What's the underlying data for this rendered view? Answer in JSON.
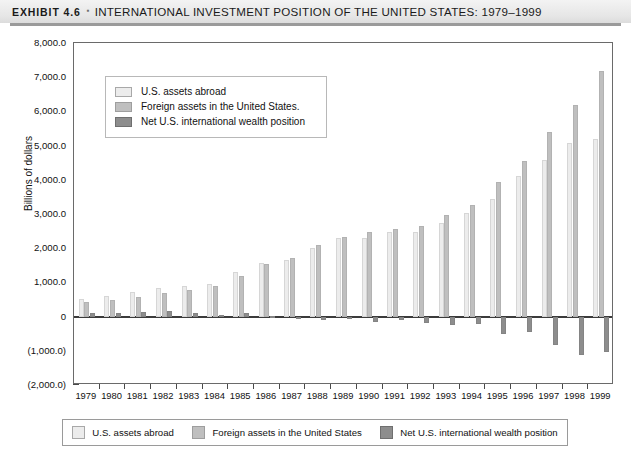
{
  "header": {
    "exhibit_label": "EXHIBIT 4.6",
    "bullet": "▪",
    "title": "INTERNATIONAL INVESTMENT POSITION OF THE UNITED STATES: 1979–1999"
  },
  "colors": {
    "series_us_assets": "#ececec",
    "series_foreign_assets": "#bfbfbf",
    "series_net_position": "#8d8d8d",
    "axis": "#3b3b3b",
    "frame": "#6a6a6a",
    "header_band": "#e6e6e6"
  },
  "inner_legend": {
    "items": [
      {
        "label": "U.S. assets abroad",
        "swatch": "sw0"
      },
      {
        "label": "Foreign assets in the United States.",
        "swatch": "sw1"
      },
      {
        "label": "Net U.S. international wealth position",
        "swatch": "sw2"
      }
    ]
  },
  "bottom_legend": {
    "items": [
      {
        "label": "U.S. assets abroad",
        "swatch": "sw0"
      },
      {
        "label": "Foreign assets in the United States",
        "swatch": "sw1"
      },
      {
        "label": "Net U.S. international wealth position",
        "swatch": "sw2"
      }
    ]
  },
  "chart_data": {
    "type": "bar",
    "title": "INTERNATIONAL INVESTMENT POSITION OF THE UNITED STATES: 1979–1999",
    "xlabel": "",
    "ylabel": "Billions of dollars",
    "ylim": [
      -2000,
      8000
    ],
    "ytick_values": [
      8000,
      7000,
      6000,
      5000,
      4000,
      3000,
      2000,
      1000,
      0,
      -1000,
      -2000
    ],
    "ytick_labels": [
      "8,000.0",
      "7,000.0",
      "6,000.0",
      "5,000.0",
      "4,000.0",
      "3,000.0",
      "2,000.0",
      "1,000.0",
      "0",
      "(1,000.0)",
      "(2,000.0)"
    ],
    "grid": false,
    "legend_position": "inside-top-left and below-plot",
    "categories": [
      "1979",
      "1980",
      "1981",
      "1982",
      "1983",
      "1984",
      "1985",
      "1986",
      "1987",
      "1988",
      "1989",
      "1990",
      "1991",
      "1992",
      "1993",
      "1994",
      "1995",
      "1996",
      "1997",
      "1998",
      "1999"
    ],
    "series": [
      {
        "name": "U.S. assets abroad",
        "color": "#ececec",
        "values": [
          510,
          610,
          720,
          840,
          900,
          960,
          1300,
          1570,
          1650,
          2000,
          2310,
          2310,
          2470,
          2470,
          2740,
          3030,
          3430,
          4110,
          4570,
          5080,
          5180
        ]
      },
      {
        "name": "Foreign assets in the United States",
        "color": "#bfbfbf",
        "values": [
          415,
          495,
          580,
          690,
          790,
          900,
          1200,
          1550,
          1710,
          2100,
          2340,
          2460,
          2560,
          2660,
          2980,
          3260,
          3950,
          4560,
          5400,
          6200,
          7180
        ]
      },
      {
        "name": "Net U.S. international wealth position",
        "color": "#8d8d8d",
        "values": [
          95,
          115,
          140,
          150,
          110,
          60,
          100,
          20,
          -60,
          -100,
          -30,
          -150,
          -90,
          -190,
          -240,
          -230,
          -520,
          -450,
          -830,
          -1120,
          -1030
        ]
      }
    ]
  }
}
